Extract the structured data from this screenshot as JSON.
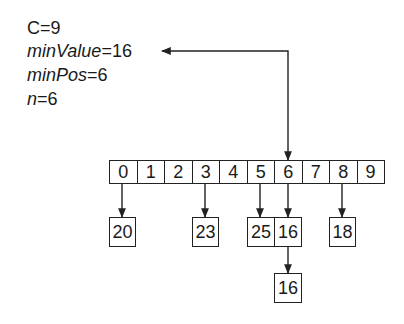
{
  "variables": [
    {
      "name": "C",
      "italic": false,
      "value": "9"
    },
    {
      "name": "minValue",
      "italic": true,
      "value": "16"
    },
    {
      "name": "minPos",
      "italic": true,
      "value": "6"
    },
    {
      "name": "n",
      "italic": true,
      "value": "6"
    }
  ],
  "equals": "=",
  "array": {
    "indices": [
      "0",
      "1",
      "2",
      "3",
      "4",
      "5",
      "6",
      "7",
      "8",
      "9"
    ]
  },
  "nodes": [
    {
      "index": "0",
      "value": "20",
      "level": 1
    },
    {
      "index": "3",
      "value": "23",
      "level": 1
    },
    {
      "index": "5",
      "value": "25",
      "level": 1
    },
    {
      "index": "6",
      "value": "16",
      "level": 1
    },
    {
      "index": "8",
      "value": "18",
      "level": 1
    },
    {
      "index": "6",
      "value": "16",
      "level": 2
    }
  ],
  "pointer": {
    "from": "minValue",
    "to_index": "6"
  },
  "colors": {
    "stroke": "#222222",
    "text": "#1a1a1a",
    "background": "#ffffff"
  }
}
